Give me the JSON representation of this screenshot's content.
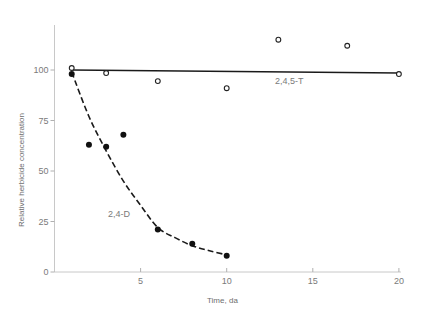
{
  "chart_data": {
    "type": "scatter",
    "title": "",
    "xlabel": "Time, da",
    "ylabel": "Relative herbicide concentration",
    "xlim": [
      0,
      20
    ],
    "ylim": [
      0,
      120
    ],
    "x_ticks": [
      5,
      10,
      15,
      20
    ],
    "y_ticks": [
      0,
      25,
      50,
      75,
      100
    ],
    "grid": false,
    "legend": "none (inline series labels)",
    "series": [
      {
        "name": "2,4,5-T",
        "marker": "open-circle",
        "points": [
          [
            1,
            101
          ],
          [
            3,
            98.5
          ],
          [
            6,
            94.5
          ],
          [
            10,
            91
          ],
          [
            13,
            115
          ],
          [
            17,
            112
          ],
          [
            20,
            98
          ]
        ],
        "fit": {
          "style": "solid",
          "type": "linear",
          "points": [
            [
              1,
              100
            ],
            [
              20,
              98.5
            ]
          ]
        },
        "label_position": [
          12.8,
          93
        ]
      },
      {
        "name": "2,4-D",
        "marker": "filled-circle",
        "points": [
          [
            1,
            98
          ],
          [
            2,
            63
          ],
          [
            3,
            62
          ],
          [
            4,
            68
          ],
          [
            6,
            21
          ],
          [
            8,
            14
          ],
          [
            10,
            8
          ]
        ],
        "fit": {
          "style": "dashed",
          "type": "exponential-decay",
          "points": [
            [
              1,
              99
            ],
            [
              2,
              77
            ],
            [
              3,
              60
            ],
            [
              4,
              45
            ],
            [
              5,
              33
            ],
            [
              6,
              22
            ],
            [
              7,
              17
            ],
            [
              8,
              13
            ],
            [
              9,
              10.5
            ],
            [
              10,
              8.5
            ]
          ]
        },
        "label_position": [
          3.1,
          27
        ]
      }
    ]
  }
}
